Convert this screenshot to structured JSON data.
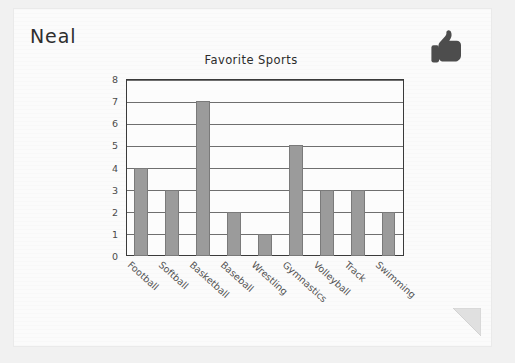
{
  "worksheet": {
    "student_name": "Neal",
    "thumb_icon": "thumbs-up-icon",
    "folded_corner_icon": "page-fold-icon"
  },
  "chart_data": {
    "type": "bar",
    "title": "Favorite Sports",
    "xlabel": "",
    "ylabel": "",
    "categories": [
      "Football",
      "Softball",
      "Basketball",
      "Baseball",
      "Wrestling",
      "Gymnastics",
      "Volleyball",
      "Track",
      "Swimming"
    ],
    "values": [
      4,
      3,
      7,
      2,
      1,
      5,
      3,
      3,
      2
    ],
    "ylim": [
      0,
      8
    ],
    "ytick_labels": [
      "0",
      "1",
      "2",
      "3",
      "4",
      "5",
      "6",
      "7",
      "8"
    ],
    "ytick_values": [
      0,
      1,
      2,
      3,
      4,
      5,
      6,
      7,
      8
    ],
    "grid": true,
    "legend": false,
    "bar_color": "#9b9b9b",
    "bar_edge_color": "#7a7a7a",
    "frame_color": "#3a3a3a",
    "grid_color": "#6f6f6f"
  }
}
